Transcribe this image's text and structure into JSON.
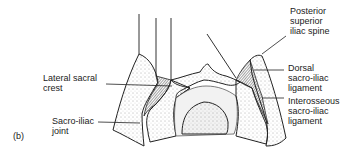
{
  "figure_label": "(b)",
  "labels": {
    "lateral_sacral_crest": "Lateral sacral\ncrest",
    "sacro_iliac_joint": "Sacro-iliac\njoint",
    "posterior_superior_iliac_spine": "Posterior\nsuperior\niliac spine",
    "dorsal_sacro_iliac_ligament": "Dorsal\nsacro-iliac\nligament",
    "interosseous_sacro_iliac_ligament": "Interosseous\nsacro-iliac\nligament"
  }
}
